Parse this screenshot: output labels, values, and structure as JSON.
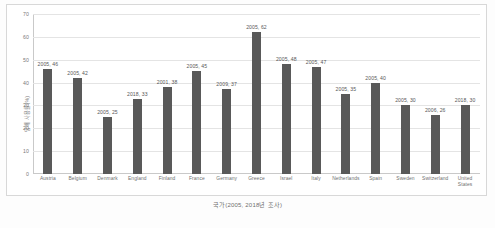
{
  "chart_data": {
    "type": "bar",
    "title": "",
    "xlabel": "국가(2005, 2018년 조사)",
    "ylabel": "담배 사용률(%)",
    "ylim": [
      0,
      70
    ],
    "yticks": [
      0,
      10,
      20,
      30,
      40,
      50,
      60,
      70
    ],
    "grid": true,
    "legend": "none",
    "bar_color": "#595959",
    "categories": [
      "Austria",
      "Belgium",
      "Denmark",
      "England",
      "Finland",
      "France",
      "Germany",
      "Greece",
      "Israel",
      "Italy",
      "Netherlands",
      "Spain",
      "Sweden",
      "Switzerland",
      "United States"
    ],
    "values": [
      46,
      42,
      25,
      33,
      38,
      45,
      37,
      62,
      48,
      47,
      35,
      40,
      30,
      26,
      30
    ],
    "survey_years": [
      2005,
      2005,
      2005,
      2018,
      2001,
      2005,
      2009,
      2005,
      2005,
      2005,
      2005,
      2005,
      2005,
      2006,
      2018
    ],
    "point_labels": [
      "2005, 46",
      "2005, 42",
      "2005, 25",
      "2018, 33",
      "2001, 38",
      "2005, 45",
      "2009, 37",
      "2005, 62",
      "2005, 48",
      "2005, 47",
      "2005, 35",
      "2005, 40",
      "2005, 30",
      "2006, 26",
      "2018, 30"
    ]
  }
}
